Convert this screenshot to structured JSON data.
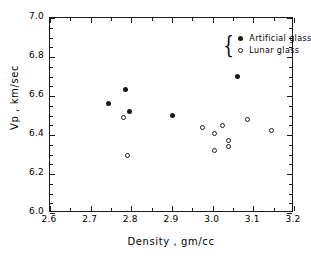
{
  "chart_data": {
    "type": "scatter",
    "title": "",
    "xlabel": "Density  ,  gm/cc",
    "ylabel": "Vp ,  km/sec",
    "xlim": [
      2.6,
      3.2
    ],
    "ylim": [
      6.0,
      7.0
    ],
    "xticks": [
      "2.6",
      "2.7",
      "2.8",
      "2.9",
      "3.0",
      "3.1",
      "3.2"
    ],
    "xtick_values": [
      2.6,
      2.7,
      2.8,
      2.9,
      3.0,
      3.1,
      3.2
    ],
    "yticks": [
      "6.0",
      "6.2",
      "6.4",
      "6.6",
      "6.8",
      "7.0"
    ],
    "ytick_values": [
      6.0,
      6.2,
      6.4,
      6.6,
      6.8,
      7.0
    ],
    "x_minor_step": 0.05,
    "y_minor_step": 0.05,
    "grid": false,
    "legend_position": "top-right",
    "legend_brace": "{",
    "series": [
      {
        "name": "Artificial glass",
        "marker": "filled-circle",
        "color": "#1a1a1a",
        "points": [
          {
            "x": 2.745,
            "y": 6.56
          },
          {
            "x": 2.785,
            "y": 6.635
          },
          {
            "x": 2.795,
            "y": 6.52
          },
          {
            "x": 2.9,
            "y": 6.5
          },
          {
            "x": 3.06,
            "y": 6.7
          }
        ]
      },
      {
        "name": "Lunar glass",
        "marker": "open-circle",
        "color": "#1a1a1a",
        "points": [
          {
            "x": 2.78,
            "y": 6.49
          },
          {
            "x": 2.79,
            "y": 6.295
          },
          {
            "x": 2.975,
            "y": 6.44
          },
          {
            "x": 3.005,
            "y": 6.41
          },
          {
            "x": 3.005,
            "y": 6.32
          },
          {
            "x": 3.025,
            "y": 6.45
          },
          {
            "x": 3.04,
            "y": 6.37
          },
          {
            "x": 3.04,
            "y": 6.34
          },
          {
            "x": 3.085,
            "y": 6.48
          },
          {
            "x": 3.145,
            "y": 6.425
          }
        ]
      }
    ]
  }
}
